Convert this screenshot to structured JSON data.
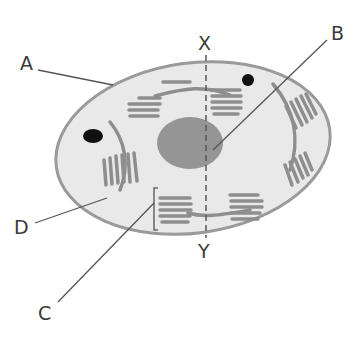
{
  "diagram": {
    "labels": {
      "A": "A",
      "B": "B",
      "C": "C",
      "D": "D",
      "X": "X",
      "Y": "Y"
    },
    "colors": {
      "cell_fill": "#e9e9e9",
      "membrane": "#9a9a9a",
      "organelle": "#8e8e8e",
      "nucleus": "#959595",
      "dark_body": "#111111",
      "leader_line": "#555555",
      "text": "#3a3a3a"
    }
  }
}
